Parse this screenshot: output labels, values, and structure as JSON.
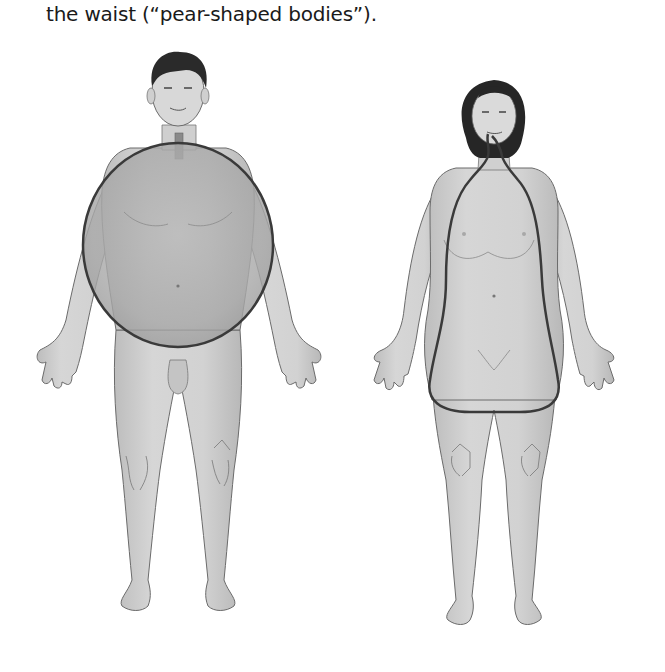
{
  "caption": {
    "text": "the waist (“pear-shaped bodies”)."
  },
  "figure": {
    "figures": [
      {
        "id": "male",
        "shape": "apple",
        "outline": "circle around torso/abdomen"
      },
      {
        "id": "female",
        "shape": "pear",
        "outline": "pear outline from neck to hips/thighs"
      }
    ],
    "colors": {
      "skin": "#c9c9c9",
      "skin_dark": "#b4b4b4",
      "skin_light": "#dedede",
      "hair": "#2a2a2a",
      "outline": "#3a3a3a",
      "apple_fill": "#b0b0b0"
    }
  }
}
